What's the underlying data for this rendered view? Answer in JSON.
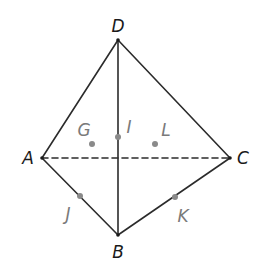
{
  "diagram": {
    "type": "tetrahedron-net",
    "colors": {
      "edge": "#2b2b2b",
      "point_dot": "#8a8a8a",
      "primary_label": "#1a1a1a",
      "secondary_label": "#7a7a7a",
      "background": "#ffffff"
    },
    "vertices": [
      {
        "id": "D",
        "label": "D",
        "x": 118,
        "y": 40
      },
      {
        "id": "A",
        "label": "A",
        "x": 42,
        "y": 158
      },
      {
        "id": "C",
        "label": "C",
        "x": 230,
        "y": 158
      },
      {
        "id": "B",
        "label": "B",
        "x": 118,
        "y": 235
      }
    ],
    "edges": [
      {
        "from": "D",
        "to": "A",
        "style": "solid"
      },
      {
        "from": "D",
        "to": "C",
        "style": "solid"
      },
      {
        "from": "D",
        "to": "B",
        "style": "solid"
      },
      {
        "from": "A",
        "to": "B",
        "style": "solid"
      },
      {
        "from": "C",
        "to": "B",
        "style": "solid"
      },
      {
        "from": "A",
        "to": "C",
        "style": "dashed"
      }
    ],
    "points": [
      {
        "id": "G",
        "label": "G",
        "x": 92,
        "y": 144
      },
      {
        "id": "I",
        "label": "I",
        "x": 118,
        "y": 137
      },
      {
        "id": "L",
        "label": "L",
        "x": 155,
        "y": 144
      },
      {
        "id": "J",
        "label": "J",
        "x": 80,
        "y": 196
      },
      {
        "id": "K",
        "label": "K",
        "x": 175,
        "y": 197
      }
    ]
  }
}
